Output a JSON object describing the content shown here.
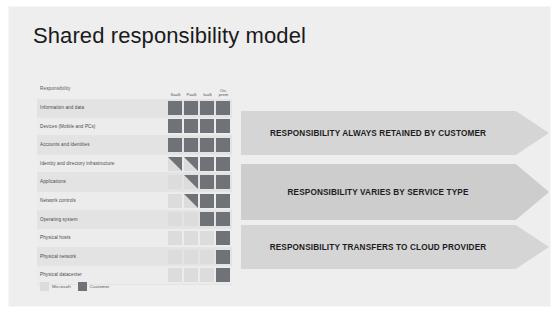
{
  "slide": {
    "title": "Shared responsibility model",
    "background_color": "#eeeeee"
  },
  "matrix": {
    "responsibility_header": "Responsibility",
    "columns": [
      {
        "label": "SaaS"
      },
      {
        "label": "PaaS"
      },
      {
        "label": "IaaS"
      },
      {
        "label": "On-prem"
      }
    ],
    "rows": [
      {
        "label": "Information and data",
        "cells": [
          "customer",
          "customer",
          "customer",
          "customer"
        ]
      },
      {
        "label": "Devices (Mobile and PCs)",
        "cells": [
          "customer",
          "customer",
          "customer",
          "customer"
        ]
      },
      {
        "label": "Accounts and identities",
        "cells": [
          "customer",
          "customer",
          "customer",
          "customer"
        ]
      },
      {
        "label": "Identity and directory infrastructure",
        "cells": [
          "split",
          "split",
          "customer",
          "customer"
        ]
      },
      {
        "label": "Applications",
        "cells": [
          "microsoft",
          "split",
          "customer",
          "customer"
        ]
      },
      {
        "label": "Network controls",
        "cells": [
          "microsoft",
          "split",
          "customer",
          "customer"
        ]
      },
      {
        "label": "Operating system",
        "cells": [
          "microsoft",
          "microsoft",
          "customer",
          "customer"
        ]
      },
      {
        "label": "Physical hosts",
        "cells": [
          "microsoft",
          "microsoft",
          "microsoft",
          "customer"
        ]
      },
      {
        "label": "Physical network",
        "cells": [
          "microsoft",
          "microsoft",
          "microsoft",
          "customer"
        ]
      },
      {
        "label": "Physical datacenter",
        "cells": [
          "microsoft",
          "microsoft",
          "microsoft",
          "customer"
        ]
      }
    ]
  },
  "legend": {
    "items": [
      {
        "label": "Microsoft",
        "color": "#dcdcdc"
      },
      {
        "label": "Customer",
        "color": "#6f7276"
      }
    ]
  },
  "banners": [
    {
      "text": "RESPONSIBILITY ALWAYS RETAINED BY CUSTOMER"
    },
    {
      "text": "RESPONSIBILITY VARIES BY SERVICE TYPE"
    },
    {
      "text": "RESPONSIBILITY TRANSFERS TO CLOUD PROVIDER"
    }
  ]
}
